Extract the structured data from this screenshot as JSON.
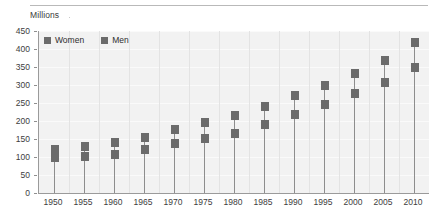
{
  "axis_caption": "Millions",
  "legend": {
    "items": [
      {
        "label": "Women",
        "color": "#6b6b6b"
      },
      {
        "label": "Men",
        "color": "#6b6b6b"
      }
    ]
  },
  "colors": {
    "marker": "#6b6b6b",
    "stem": "#8d8d8d",
    "plot_background": "#f2f2f2",
    "gridline": "#fafafa",
    "axis": "#9a9a9a",
    "top_rule": "#b9b9b9",
    "text": "#3d3d3d"
  },
  "chart_data": {
    "type": "line",
    "title": "",
    "subtitle": "",
    "xlabel": "",
    "ylabel": "Millions",
    "ylim": [
      0,
      450
    ],
    "ytick_step": 50,
    "yticks": [
      0,
      50,
      100,
      150,
      200,
      250,
      300,
      350,
      400,
      450
    ],
    "grid": true,
    "legend_position": "top-left",
    "marker_style": "square",
    "stems": true,
    "categories": [
      "1950",
      "1955",
      "1960",
      "1965",
      "1970",
      "1975",
      "1980",
      "1985",
      "1990",
      "1995",
      "2000",
      "2005",
      "2010"
    ],
    "series": [
      {
        "name": "Women",
        "values": [
          100,
          102,
          108,
          122,
          137,
          152,
          166,
          189,
          217,
          245,
          276,
          306,
          349
        ]
      },
      {
        "name": "Men",
        "values": [
          120,
          128,
          140,
          155,
          177,
          197,
          214,
          240,
          270,
          300,
          333,
          368,
          418
        ]
      }
    ]
  }
}
